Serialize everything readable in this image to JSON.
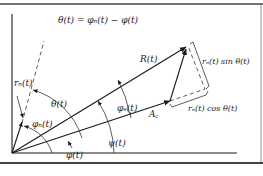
{
  "figure": {
    "equation": "θ(t) = φₙ(t) − φ(t)",
    "labels": {
      "resultant": "R(t)",
      "noise_amplitude": "rₙ(t)",
      "carrier_amplitude": "A꜀",
      "theta": "θ(t)",
      "phi_n": "φₙ(t)",
      "phi_e": "φₑ(t)",
      "phi": "φ(t)",
      "psi": "ψ(t)",
      "sin_component": "rₙ(t) sin θ(t)",
      "cos_component": "rₙ(t) cos θ(t)"
    },
    "colors": {
      "line": "#1a1a1a",
      "background": "#ffffff"
    }
  }
}
